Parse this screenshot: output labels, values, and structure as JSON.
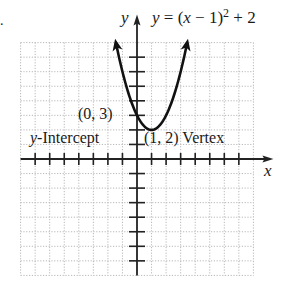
{
  "chart_data": {
    "type": "line",
    "equation": {
      "prefix": "y = (x − 1)",
      "exponent": "2",
      "suffix": " + 2"
    },
    "xlabel": "x",
    "ylabel": "y",
    "xlim": [
      -8,
      8
    ],
    "ylim": [
      -8,
      8
    ],
    "grid": true,
    "grid_style": "dotted",
    "x_ticks": [
      -7,
      -6,
      -5,
      -4,
      -3,
      -2,
      -1,
      1,
      2,
      3,
      4,
      5,
      6,
      7
    ],
    "y_ticks": [
      -7,
      -6,
      -5,
      -4,
      -3,
      -2,
      -1,
      1,
      2,
      3,
      4,
      5,
      6,
      7
    ],
    "series": [
      {
        "name": "y = (x − 1)² + 2",
        "function": "(x-1)^2+2",
        "x_range": [
          -1.45,
          3.45
        ],
        "arrows": "both ends"
      }
    ],
    "points": [
      {
        "x": 0,
        "y": 3
      },
      {
        "x": 1,
        "y": 2
      }
    ],
    "annotations": [
      {
        "text": "(0, 3)",
        "target": [
          0,
          3
        ]
      },
      {
        "text": "y-Intercept",
        "target": [
          0,
          3
        ]
      },
      {
        "text": "(1, 2) Vertex",
        "target": [
          1,
          2
        ]
      }
    ]
  },
  "labels": {
    "y_axis": "y",
    "x_axis": "x",
    "eq_prefix": "y = (x − 1)",
    "eq_exp": "2",
    "eq_suffix": " + 2",
    "intercept_point": "(0, 3)",
    "intercept_italic": "y",
    "intercept_text": "-Intercept",
    "vertex_text": "(1, 2) Vertex"
  },
  "colors": {
    "grid": "#b8b8b8",
    "axis": "#222222",
    "curve": "#111111"
  }
}
